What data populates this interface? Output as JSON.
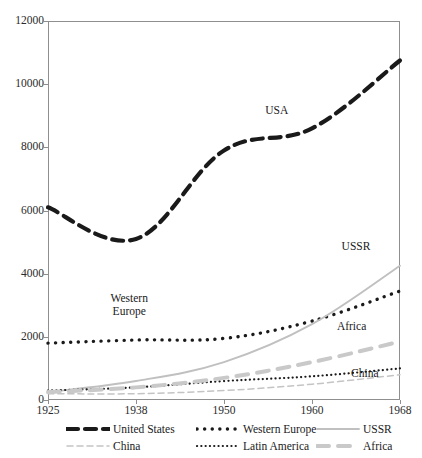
{
  "figure": {
    "top_cropped_text": "",
    "background": "#ffffff",
    "frame_color": "#8f8f8f"
  },
  "chart_data": {
    "type": "line",
    "title": "",
    "xlabel": "",
    "ylabel": "",
    "categories": [
      "1925",
      "1938",
      "1950",
      "1960",
      "1968"
    ],
    "x": [
      1925,
      1938,
      1950,
      1960,
      1968
    ],
    "ylim": [
      0,
      12000
    ],
    "yticks": [
      0,
      2000,
      4000,
      6000,
      8000,
      10000,
      12000
    ],
    "ytick_labels": [
      "0",
      "2000",
      "4000",
      "6000",
      "8000",
      "10000",
      "12000"
    ],
    "grid": false,
    "legend_position": "below-axes",
    "series": [
      {
        "name": "United States",
        "values": [
          6100,
          5100,
          7900,
          8600,
          10750
        ],
        "color": "#1a1a1a",
        "style": "thick-dashed",
        "width": 4.2,
        "dash": "11 7"
      },
      {
        "name": "Western Europe",
        "values": [
          1800,
          1900,
          1950,
          2500,
          3450
        ],
        "color": "#1a1a1a",
        "style": "bold-dotted",
        "width": 3.4,
        "dash": "0.1 7.5"
      },
      {
        "name": "USSR",
        "values": [
          250,
          600,
          1200,
          2400,
          4250
        ],
        "color": "#c0c0c0",
        "style": "solid",
        "width": 1.9,
        "dash": "none"
      },
      {
        "name": "China",
        "values": [
          200,
          200,
          300,
          500,
          800
        ],
        "color": "#c4c4c4",
        "style": "dashed",
        "width": 1.5,
        "dash": "6 4"
      },
      {
        "name": "Latin America",
        "values": [
          300,
          400,
          600,
          750,
          1000
        ],
        "color": "#1a1a1a",
        "style": "fine-dotted",
        "width": 2.2,
        "dash": "0.1 4.2"
      },
      {
        "name": "Africa",
        "values": [
          250,
          400,
          700,
          1200,
          1850
        ],
        "color": "#c9c9c9",
        "style": "thick-dashed",
        "width": 4.0,
        "dash": "12 9"
      }
    ],
    "annotations": [
      {
        "text": "USA",
        "x": 1956.0,
        "y": 9150
      },
      {
        "text": "Western\nEurope",
        "x": 1937.0,
        "y": 3200
      },
      {
        "text": "USSR",
        "x": 1964.0,
        "y": 4850
      },
      {
        "text": "Africa",
        "x": 1963.6,
        "y": 2300
      },
      {
        "text": "China",
        "x": 1964.8,
        "y": 830
      }
    ],
    "legend": [
      {
        "label": "United States",
        "key": "thick-dashed-black"
      },
      {
        "label": "Western Europe",
        "key": "bold-dotted-black"
      },
      {
        "label": "USSR",
        "key": "solid-gray"
      },
      {
        "label": "China",
        "key": "dashed-gray"
      },
      {
        "label": "Latin America",
        "key": "fine-dotted-black"
      },
      {
        "label": "Africa",
        "key": "thick-dashed-gray"
      }
    ]
  }
}
